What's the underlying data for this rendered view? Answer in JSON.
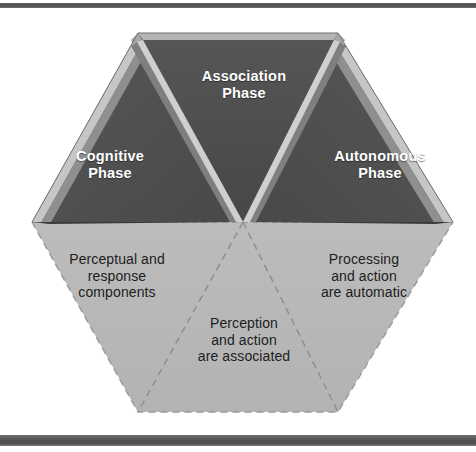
{
  "figure": {
    "name": "three-phase-learning-hexagon",
    "type": "diagram",
    "shape": "hexagon",
    "colors": {
      "triangle_fill": "#4e4e4e",
      "bevel_light": "#c9c9c9",
      "bevel_mid": "#9a9a9a",
      "bevel_dark": "#3c3c3c",
      "lower_fill": "#b9b9b9",
      "dashed_line": "#8d8d8d",
      "upper_text": "#ffffff",
      "lower_text": "#1d1d1d",
      "rule_bar": "#545454",
      "page_background": "#ffffff"
    }
  },
  "rules": {
    "top_bar": "top-horizontal-rule",
    "bottom_bar": "bottom-horizontal-rule"
  },
  "upper_faces": [
    {
      "id": "cognitive",
      "label": "Cognitive\nPhase",
      "position": "left"
    },
    {
      "id": "association",
      "label": "Association\nPhase",
      "position": "top-center"
    },
    {
      "id": "autonomous",
      "label": "Autonomous\nPhase",
      "position": "right"
    }
  ],
  "lower_faces": [
    {
      "id": "perceptual",
      "label": "Perceptual and\nresponse\ncomponents",
      "position": "lower-left"
    },
    {
      "id": "perception",
      "label": "Perception\nand action\nare associated",
      "position": "lower-center"
    },
    {
      "id": "processing",
      "label": "Processing\nand action\nare automatic",
      "position": "lower-right"
    }
  ]
}
